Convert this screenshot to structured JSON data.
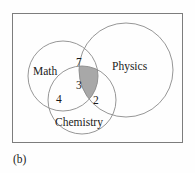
{
  "figure": {
    "caption": "(b)",
    "diagram_type": "venn-diagram-three-set",
    "colors": {
      "frame_border": "#7d7d7d",
      "circle_stroke": "#8a8a8a",
      "shaded_region_fill": "#a8a8a8",
      "background": "#fefefe",
      "text": "#1a1a1a"
    },
    "sets": [
      {
        "id": "math",
        "label": "Math",
        "cx": 62,
        "cy": 75,
        "r": 35,
        "label_x": 45,
        "label_y": 71
      },
      {
        "id": "physics",
        "label": "Physics",
        "cx": 125,
        "cy": 69,
        "r": 47,
        "label_x": 133,
        "label_y": 66
      },
      {
        "id": "chemistry",
        "label": "Chemistry",
        "cx": 81,
        "cy": 99,
        "r": 34,
        "label_x": 80,
        "label_y": 122
      }
    ],
    "regions": [
      {
        "id": "math-physics",
        "value": "7",
        "x": 79,
        "y": 62,
        "shaded": false
      },
      {
        "id": "math-physics-chemistry",
        "value": "3",
        "x": 79,
        "y": 85,
        "shaded": true
      },
      {
        "id": "math-chemistry",
        "value": "4",
        "x": 59,
        "y": 99,
        "shaded": false
      },
      {
        "id": "physics-chemistry",
        "value": "2",
        "x": 96,
        "y": 100,
        "shaded": false
      }
    ]
  }
}
